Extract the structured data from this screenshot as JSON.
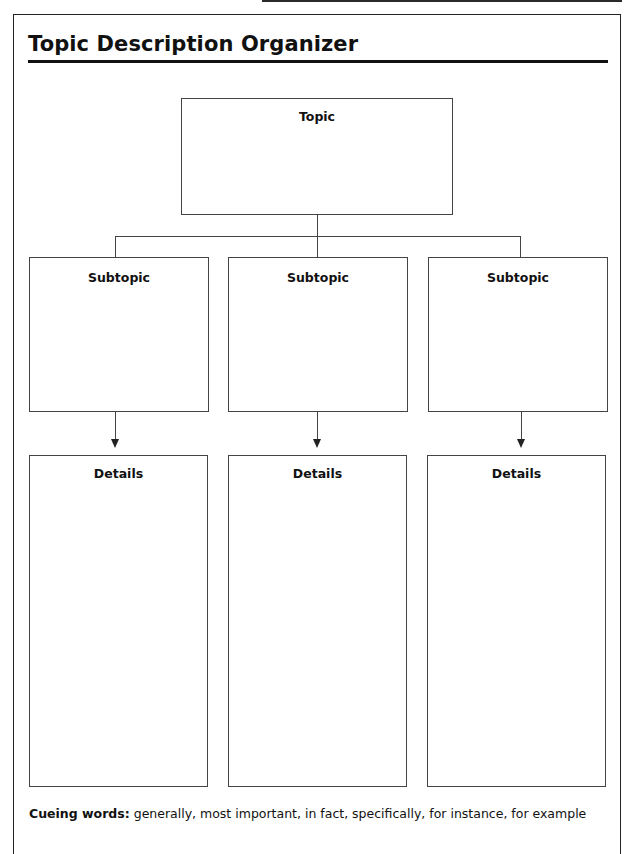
{
  "page": {
    "title": "Topic Description Organizer"
  },
  "diagram": {
    "topic": {
      "label": "Topic"
    },
    "subtopics": [
      {
        "label": "Subtopic"
      },
      {
        "label": "Subtopic"
      },
      {
        "label": "Subtopic"
      }
    ],
    "details": [
      {
        "label": "Details"
      },
      {
        "label": "Details"
      },
      {
        "label": "Details"
      }
    ]
  },
  "footer": {
    "cue_label": "Cueing words:",
    "cue_text": " generally, most important, in fact, specifically, for instance, for example"
  }
}
